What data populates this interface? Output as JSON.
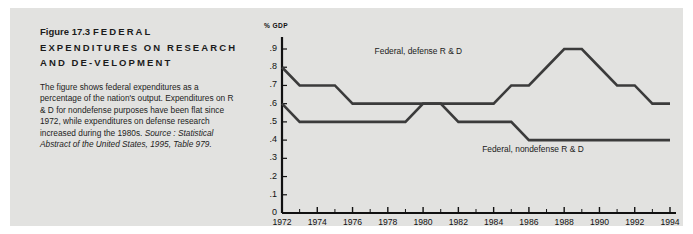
{
  "figure": {
    "number": "Figure 17.3",
    "headline": "FEDERAL EXPENDITURES ON RESEARCH AND DE-VELOPMENT",
    "caption": "The figure shows federal expenditures as a percentage of the nation's output. Expenditures on R & D for nondefense purposes have been flat since 1972, while expenditures on defense research increased during the 1980s. ",
    "source_label": "Source :",
    "source_text": "Statistical Abstract of the United States, 1995, Table 979."
  },
  "colors": {
    "panel_background": "#e2e2e0",
    "page_background": "#ffffff",
    "line": "#3b3b3b",
    "axis": "#111111",
    "text": "#1b1b1b"
  },
  "chart_data": {
    "type": "line",
    "title": "",
    "xlabel": "",
    "ylabel": "% GDP",
    "ylim": [
      0,
      0.95
    ],
    "xlim": [
      1972,
      1994
    ],
    "grid": false,
    "legend": "inline-annotation",
    "ytick_labels": [
      ".9",
      ".8",
      ".7",
      ".6",
      ".5",
      ".4",
      ".3",
      ".2",
      ".1",
      "0"
    ],
    "ytick_values": [
      0.9,
      0.8,
      0.7,
      0.6,
      0.5,
      0.4,
      0.3,
      0.2,
      0.1,
      0.0
    ],
    "xtick_labels": [
      "1972",
      "1974",
      "1976",
      "1978",
      "1980",
      "1982",
      "1984",
      "1986",
      "1988",
      "1990",
      "1992",
      "1994"
    ],
    "xtick_values": [
      1972,
      1974,
      1976,
      1978,
      1980,
      1982,
      1984,
      1986,
      1988,
      1990,
      1992,
      1994
    ],
    "x": [
      1972,
      1973,
      1974,
      1975,
      1976,
      1977,
      1978,
      1979,
      1980,
      1981,
      1982,
      1983,
      1984,
      1985,
      1986,
      1987,
      1988,
      1989,
      1990,
      1991,
      1992,
      1993,
      1994
    ],
    "series": [
      {
        "name": "Federal, defense R & D",
        "label_x": 1980.2,
        "label_y": 0.885,
        "values": [
          0.8,
          0.7,
          0.7,
          0.7,
          0.6,
          0.6,
          0.6,
          0.6,
          0.6,
          0.6,
          0.6,
          0.6,
          0.6,
          0.7,
          0.7,
          0.8,
          0.9,
          0.9,
          0.8,
          0.7,
          0.7,
          0.6,
          0.6
        ]
      },
      {
        "name": "Federal, nondefense R & D",
        "label_x": 1986.3,
        "label_y": 0.345,
        "values": [
          0.6,
          0.5,
          0.5,
          0.5,
          0.5,
          0.5,
          0.5,
          0.5,
          0.6,
          0.6,
          0.5,
          0.5,
          0.5,
          0.5,
          0.4,
          0.4,
          0.4,
          0.4,
          0.4,
          0.4,
          0.4,
          0.4,
          0.4
        ]
      }
    ]
  }
}
